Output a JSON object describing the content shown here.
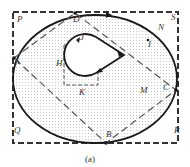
{
  "figure": {
    "caption": "(a)",
    "colors": {
      "stroke": "#1a1a1a",
      "dash": "#555555",
      "fill_dots": "#bdbdbd",
      "background": "#ffffff"
    },
    "labels": {
      "P": "P",
      "D": "D",
      "S": "S",
      "N": "N",
      "I": "I",
      "A": "A",
      "J": "J",
      "H": "H",
      "K": "K",
      "M": "M",
      "C": "C",
      "B": "B",
      "Q": "Q",
      "R": "R"
    },
    "elements": [
      "outer dashed rectangle PQRS",
      "elliptical boundary (solid) with shaded interior",
      "dashed inner diamond A-D-C-B",
      "teardrop hole with arrow apex",
      "small dashed square around hole (H, J, K)"
    ]
  }
}
